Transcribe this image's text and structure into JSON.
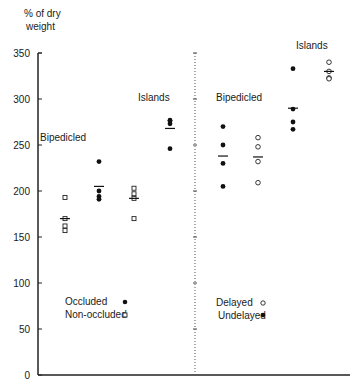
{
  "chart_data": {
    "type": "scatter",
    "title": "",
    "ylabel": "% of dry weight",
    "ylabel_lines": [
      "% of dry",
      "weight"
    ],
    "xlabel": "",
    "ylim": [
      0,
      350
    ],
    "yticks": [
      0,
      50,
      100,
      150,
      200,
      250,
      300,
      350
    ],
    "grid": false,
    "divider": "dotted vertical line between left and right panels",
    "panels": [
      {
        "name": "left",
        "legend": [
          {
            "label": "Occluded",
            "marker": "filled-circle"
          },
          {
            "label": "Non-occluded",
            "marker": "open-square"
          }
        ],
        "groups": [
          {
            "label": "Bipedicled",
            "series": [
              {
                "name": "Non-occluded",
                "marker": "open-square",
                "values": [
                  193,
                  170,
                  162,
                  157
                ],
                "mean": 170
              },
              {
                "name": "Occluded",
                "marker": "filled-circle",
                "values": [
                  232,
                  200,
                  194,
                  191
                ],
                "mean": 205
              }
            ]
          },
          {
            "label": "Islands",
            "series": [
              {
                "name": "Non-occluded",
                "marker": "open-square",
                "values": [
                  203,
                  197,
                  192,
                  170
                ],
                "mean": 192
              },
              {
                "name": "Occluded",
                "marker": "filled-circle",
                "values": [
                  277,
                  276,
                  273,
                  246
                ],
                "mean": 268
              }
            ]
          }
        ]
      },
      {
        "name": "right",
        "legend": [
          {
            "label": "Delayed",
            "marker": "open-circle"
          },
          {
            "label": "Undelayed",
            "marker": "filled-circle"
          }
        ],
        "groups": [
          {
            "label": "Bipedicled",
            "series": [
              {
                "name": "Undelayed",
                "marker": "filled-circle",
                "values": [
                  270,
                  250,
                  230,
                  205
                ],
                "mean": 238
              },
              {
                "name": "Delayed",
                "marker": "open-circle",
                "values": [
                  258,
                  248,
                  232,
                  209
                ],
                "mean": 237
              }
            ]
          },
          {
            "label": "Islands",
            "series": [
              {
                "name": "Undelayed",
                "marker": "filled-circle",
                "values": [
                  333,
                  289,
                  275,
                  267
                ],
                "mean": 290
              },
              {
                "name": "Delayed",
                "marker": "open-circle",
                "values": [
                  340,
                  330,
                  323,
                  322
                ],
                "mean": 330
              }
            ]
          }
        ]
      }
    ]
  },
  "labels": {
    "ylabel_line1": "% of dry",
    "ylabel_line2": "weight",
    "left_bipedicled": "Bipedicled",
    "left_islands": "Islands",
    "right_bipedicled": "Bipedicled",
    "right_islands": "Islands",
    "legend_occluded": "Occluded",
    "legend_non_occluded": "Non-occluded",
    "legend_delayed": "Delayed",
    "legend_undelayed": "Undelayed"
  },
  "ticks": [
    "350",
    "300",
    "250",
    "200",
    "150",
    "100",
    "50",
    "0"
  ]
}
